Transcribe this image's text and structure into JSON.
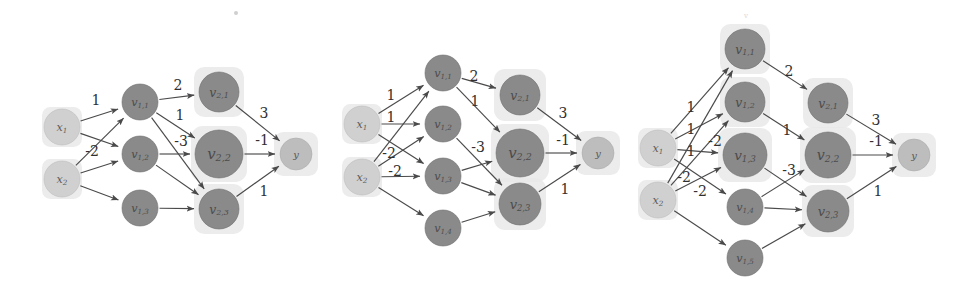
{
  "figure": {
    "type": "diagram",
    "canvas": {
      "width": 968,
      "height": 294,
      "background": "#ffffff"
    },
    "colors": {
      "hidden_node": "#8a8a8a",
      "input_node": "#d0d0d0",
      "output_node": "#bdbdbd",
      "halo": "#e9e9e9",
      "edge": "#4a4a4a",
      "label_text": "#303030"
    }
  },
  "diagrams": [
    {
      "id": "left",
      "name": "network-left",
      "nodes": [
        {
          "id": "x1",
          "label": "x",
          "sub": "1",
          "x": 62,
          "y": 127,
          "r": 18,
          "kind": "input",
          "halo": true,
          "halo_r": 20
        },
        {
          "id": "x2",
          "label": "x",
          "sub": "2",
          "x": 62,
          "y": 179,
          "r": 18,
          "kind": "input",
          "halo": true,
          "halo_r": 20
        },
        {
          "id": "v11",
          "label": "v",
          "sub": "1,1",
          "x": 140,
          "y": 102,
          "r": 18,
          "kind": "hidden",
          "halo": false,
          "halo_r": 0
        },
        {
          "id": "v12",
          "label": "v",
          "sub": "1,2",
          "x": 140,
          "y": 154,
          "r": 18,
          "kind": "hidden",
          "halo": false,
          "halo_r": 0
        },
        {
          "id": "v13",
          "label": "v",
          "sub": "1,3",
          "x": 140,
          "y": 208,
          "r": 18,
          "kind": "hidden",
          "halo": false,
          "halo_r": 0
        },
        {
          "id": "v21",
          "label": "v",
          "sub": "2,1",
          "x": 219,
          "y": 92,
          "r": 20,
          "kind": "hidden",
          "halo": true,
          "halo_r": 25
        },
        {
          "id": "v22",
          "label": "v",
          "sub": "2,2",
          "x": 219,
          "y": 154,
          "r": 24,
          "kind": "hidden",
          "halo": true,
          "halo_r": 28
        },
        {
          "id": "v23",
          "label": "v",
          "sub": "2,3",
          "x": 219,
          "y": 209,
          "r": 20,
          "kind": "hidden",
          "halo": true,
          "halo_r": 25
        },
        {
          "id": "y",
          "label": "y",
          "sub": "",
          "x": 296,
          "y": 154,
          "r": 16,
          "kind": "output",
          "halo": true,
          "halo_r": 22
        }
      ],
      "edges": [
        {
          "from": "x1",
          "to": "v11",
          "weight": "1",
          "lx": 96,
          "ly": 101
        },
        {
          "from": "x1",
          "to": "v12",
          "weight": "",
          "lx": 0,
          "ly": 0
        },
        {
          "from": "x2",
          "to": "v11",
          "weight": "-2",
          "lx": 92,
          "ly": 152
        },
        {
          "from": "x2",
          "to": "v12",
          "weight": "",
          "lx": 0,
          "ly": 0
        },
        {
          "from": "x2",
          "to": "v13",
          "weight": "",
          "lx": 0,
          "ly": 0
        },
        {
          "from": "v11",
          "to": "v21",
          "weight": "2",
          "lx": 178,
          "ly": 86
        },
        {
          "from": "v11",
          "to": "v22",
          "weight": "1",
          "lx": 180,
          "ly": 116
        },
        {
          "from": "v11",
          "to": "v23",
          "weight": "",
          "lx": 0,
          "ly": 0
        },
        {
          "from": "v12",
          "to": "v22",
          "weight": "-3",
          "lx": 181,
          "ly": 142
        },
        {
          "from": "v12",
          "to": "v23",
          "weight": "",
          "lx": 0,
          "ly": 0
        },
        {
          "from": "v13",
          "to": "v23",
          "weight": "",
          "lx": 0,
          "ly": 0
        },
        {
          "from": "v21",
          "to": "y",
          "weight": "3",
          "lx": 264,
          "ly": 114
        },
        {
          "from": "v22",
          "to": "y",
          "weight": "-1",
          "lx": 262,
          "ly": 141
        },
        {
          "from": "v23",
          "to": "y",
          "weight": "1",
          "lx": 264,
          "ly": 192
        }
      ]
    },
    {
      "id": "middle",
      "name": "network-middle",
      "nodes": [
        {
          "id": "x1",
          "label": "x",
          "sub": "1",
          "x": 362,
          "y": 124,
          "r": 18,
          "kind": "input",
          "halo": true,
          "halo_r": 20
        },
        {
          "id": "x2",
          "label": "x",
          "sub": "2",
          "x": 362,
          "y": 177,
          "r": 18,
          "kind": "input",
          "halo": true,
          "halo_r": 20
        },
        {
          "id": "v11",
          "label": "v",
          "sub": "1,1",
          "x": 443,
          "y": 73,
          "r": 18,
          "kind": "hidden",
          "halo": false,
          "halo_r": 0
        },
        {
          "id": "v12",
          "label": "v",
          "sub": "1,2",
          "x": 443,
          "y": 124,
          "r": 18,
          "kind": "hidden",
          "halo": false,
          "halo_r": 0
        },
        {
          "id": "v13",
          "label": "v",
          "sub": "1,3",
          "x": 443,
          "y": 176,
          "r": 18,
          "kind": "hidden",
          "halo": false,
          "halo_r": 0
        },
        {
          "id": "v14",
          "label": "v",
          "sub": "1,4",
          "x": 443,
          "y": 228,
          "r": 18,
          "kind": "hidden",
          "halo": false,
          "halo_r": 0
        },
        {
          "id": "v21",
          "label": "v",
          "sub": "2,1",
          "x": 520,
          "y": 95,
          "r": 20,
          "kind": "hidden",
          "halo": true,
          "halo_r": 26
        },
        {
          "id": "v22",
          "label": "v",
          "sub": "2,2",
          "x": 520,
          "y": 153,
          "r": 24,
          "kind": "hidden",
          "halo": true,
          "halo_r": 29
        },
        {
          "id": "v23",
          "label": "v",
          "sub": "2,3",
          "x": 520,
          "y": 204,
          "r": 21,
          "kind": "hidden",
          "halo": true,
          "halo_r": 26
        },
        {
          "id": "y",
          "label": "y",
          "sub": "",
          "x": 598,
          "y": 153,
          "r": 16,
          "kind": "output",
          "halo": true,
          "halo_r": 22
        }
      ],
      "edges": [
        {
          "from": "x1",
          "to": "v11",
          "weight": "1",
          "lx": 391,
          "ly": 96
        },
        {
          "from": "x1",
          "to": "v12",
          "weight": "1",
          "lx": 391,
          "ly": 118
        },
        {
          "from": "x1",
          "to": "v13",
          "weight": "",
          "lx": 0,
          "ly": 0
        },
        {
          "from": "x2",
          "to": "v11",
          "weight": "-2",
          "lx": 389,
          "ly": 154
        },
        {
          "from": "x2",
          "to": "v12",
          "weight": "",
          "lx": 0,
          "ly": 0
        },
        {
          "from": "x2",
          "to": "v13",
          "weight": "-2",
          "lx": 395,
          "ly": 172
        },
        {
          "from": "x2",
          "to": "v14",
          "weight": "",
          "lx": 0,
          "ly": 0
        },
        {
          "from": "v11",
          "to": "v21",
          "weight": "2",
          "lx": 474,
          "ly": 77
        },
        {
          "from": "v11",
          "to": "v22",
          "weight": "1",
          "lx": 475,
          "ly": 102
        },
        {
          "from": "v12",
          "to": "v23",
          "weight": "",
          "lx": 0,
          "ly": 0
        },
        {
          "from": "v13",
          "to": "v22",
          "weight": "-3",
          "lx": 478,
          "ly": 148
        },
        {
          "from": "v13",
          "to": "v23",
          "weight": "",
          "lx": 0,
          "ly": 0
        },
        {
          "from": "v14",
          "to": "v23",
          "weight": "",
          "lx": 0,
          "ly": 0
        },
        {
          "from": "v21",
          "to": "y",
          "weight": "3",
          "lx": 563,
          "ly": 114
        },
        {
          "from": "v22",
          "to": "y",
          "weight": "-1",
          "lx": 563,
          "ly": 141
        },
        {
          "from": "v23",
          "to": "y",
          "weight": "1",
          "lx": 565,
          "ly": 190
        }
      ]
    },
    {
      "id": "right",
      "name": "network-right",
      "nodes": [
        {
          "id": "x1",
          "label": "x",
          "sub": "1",
          "x": 658,
          "y": 148,
          "r": 18,
          "kind": "input",
          "halo": true,
          "halo_r": 20
        },
        {
          "id": "x2",
          "label": "x",
          "sub": "2",
          "x": 658,
          "y": 200,
          "r": 18,
          "kind": "input",
          "halo": true,
          "halo_r": 20
        },
        {
          "id": "v11",
          "label": "v",
          "sub": "1,1",
          "x": 745,
          "y": 49,
          "r": 20,
          "kind": "hidden",
          "halo": true,
          "halo_r": 25
        },
        {
          "id": "v12",
          "label": "v",
          "sub": "1,2",
          "x": 745,
          "y": 102,
          "r": 20,
          "kind": "hidden",
          "halo": true,
          "halo_r": 25
        },
        {
          "id": "v13",
          "label": "v",
          "sub": "1,3",
          "x": 745,
          "y": 155,
          "r": 22,
          "kind": "hidden",
          "halo": true,
          "halo_r": 27
        },
        {
          "id": "v14",
          "label": "v",
          "sub": "1,4",
          "x": 745,
          "y": 207,
          "r": 18,
          "kind": "hidden",
          "halo": false,
          "halo_r": 0
        },
        {
          "id": "v15",
          "label": "v",
          "sub": "1,5",
          "x": 745,
          "y": 258,
          "r": 18,
          "kind": "hidden",
          "halo": false,
          "halo_r": 0
        },
        {
          "id": "v21",
          "label": "v",
          "sub": "2,1",
          "x": 828,
          "y": 103,
          "r": 20,
          "kind": "hidden",
          "halo": true,
          "halo_r": 25
        },
        {
          "id": "v22",
          "label": "v",
          "sub": "2,2",
          "x": 828,
          "y": 155,
          "r": 23,
          "kind": "hidden",
          "halo": true,
          "halo_r": 28
        },
        {
          "id": "v23",
          "label": "v",
          "sub": "2,3",
          "x": 828,
          "y": 211,
          "r": 21,
          "kind": "hidden",
          "halo": true,
          "halo_r": 26
        },
        {
          "id": "y",
          "label": "y",
          "sub": "",
          "x": 914,
          "y": 155,
          "r": 16,
          "kind": "output",
          "halo": true,
          "halo_r": 22
        }
      ],
      "edges": [
        {
          "from": "x1",
          "to": "v11",
          "weight": "1",
          "lx": 691,
          "ly": 108
        },
        {
          "from": "x1",
          "to": "v12",
          "weight": "1",
          "lx": 691,
          "ly": 130
        },
        {
          "from": "x1",
          "to": "v13",
          "weight": "1",
          "lx": 691,
          "ly": 152
        },
        {
          "from": "x1",
          "to": "v14",
          "weight": "-2",
          "lx": 715,
          "ly": 142
        },
        {
          "from": "x2",
          "to": "v11",
          "weight": "-2",
          "lx": 684,
          "ly": 178
        },
        {
          "from": "x2",
          "to": "v12",
          "weight": "",
          "lx": 0,
          "ly": 0
        },
        {
          "from": "x2",
          "to": "v13",
          "weight": "-2",
          "lx": 700,
          "ly": 192
        },
        {
          "from": "x2",
          "to": "v15",
          "weight": "",
          "lx": 0,
          "ly": 0
        },
        {
          "from": "v11",
          "to": "v21",
          "weight": "2",
          "lx": 789,
          "ly": 72
        },
        {
          "from": "v12",
          "to": "v22",
          "weight": "1",
          "lx": 787,
          "ly": 131
        },
        {
          "from": "v13",
          "to": "v23",
          "weight": "-3",
          "lx": 789,
          "ly": 171
        },
        {
          "from": "v14",
          "to": "v22",
          "weight": "",
          "lx": 0,
          "ly": 0
        },
        {
          "from": "v14",
          "to": "v23",
          "weight": "",
          "lx": 0,
          "ly": 0
        },
        {
          "from": "v15",
          "to": "v23",
          "weight": "",
          "lx": 0,
          "ly": 0
        },
        {
          "from": "v21",
          "to": "y",
          "weight": "3",
          "lx": 876,
          "ly": 121
        },
        {
          "from": "v22",
          "to": "y",
          "weight": "-1",
          "lx": 876,
          "ly": 142
        },
        {
          "from": "v23",
          "to": "y",
          "weight": "1",
          "lx": 878,
          "ly": 192
        }
      ]
    }
  ],
  "artifacts": [
    {
      "name": "speck-top",
      "x": 236,
      "y": 13,
      "r": 2
    },
    {
      "name": "faint-mark-top",
      "x": 746,
      "y": 18,
      "text": "v"
    }
  ]
}
